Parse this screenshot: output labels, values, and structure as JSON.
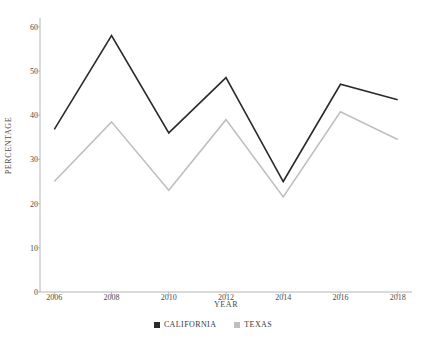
{
  "chart_data": {
    "type": "line",
    "title": "",
    "xlabel": "YEAR",
    "ylabel": "PERCENTAGE",
    "x": [
      2006,
      2008,
      2010,
      2012,
      2014,
      2016,
      2018
    ],
    "xtick_labels": [
      "2006",
      "2008",
      "2010",
      "2012",
      "2014",
      "2016",
      "2018"
    ],
    "ytick_labels": [
      "0",
      "10",
      "20",
      "30",
      "40",
      "50",
      "60"
    ],
    "yticks": [
      0,
      10,
      20,
      30,
      40,
      50,
      60
    ],
    "ylim": [
      0,
      62
    ],
    "xlim": [
      2005.5,
      2018.5
    ],
    "grid": false,
    "legend_position": "bottom-center",
    "series": [
      {
        "name": "CALIFORNIA",
        "color": "#2b2b2b",
        "values": [
          36.8,
          58.0,
          36.0,
          48.5,
          25.0,
          47.0,
          43.5
        ]
      },
      {
        "name": "TEXAS",
        "color": "#bfbfbf",
        "values": [
          25.0,
          38.5,
          23.0,
          39.0,
          21.5,
          40.8,
          34.5
        ]
      }
    ]
  },
  "legend": {
    "entries": [
      {
        "label": "CALIFORNIA",
        "color": "#2b2b2b"
      },
      {
        "label": "TEXAS",
        "color": "#bfbfbf"
      }
    ]
  },
  "axes": {
    "axis_color": "#b4b4b4",
    "tick_color": "#b4b4b4"
  }
}
